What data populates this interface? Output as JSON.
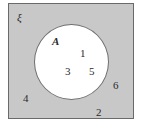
{
  "diagram": {
    "type": "venn",
    "universal_set": {
      "symbol": "ξ",
      "fill": "#c8c8c8",
      "elements_outside": [
        "4",
        "6",
        "2"
      ]
    },
    "set_a": {
      "label": "A",
      "fill": "#ffffff",
      "elements": [
        "1",
        "3",
        "5"
      ]
    },
    "labels": {
      "universe_symbol": "ξ",
      "set_a": "A",
      "e1": "1",
      "e3": "3",
      "e5": "5",
      "e4": "4",
      "e6": "6",
      "e2": "2"
    }
  }
}
